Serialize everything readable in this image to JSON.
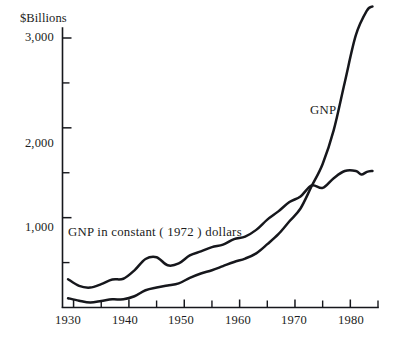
{
  "chart_data": {
    "type": "line",
    "title": "",
    "subtitle": "",
    "xlabel": "",
    "ylabel": "$Billions",
    "unit_label": "$Billions",
    "xlim": [
      1928,
      1985
    ],
    "ylim": [
      0,
      3300
    ],
    "grid": false,
    "legend_position": "inline-annotation",
    "y_ticks_major": [
      1000,
      2000,
      3000
    ],
    "y_tick_labels": [
      "1,000",
      "2,000",
      "3,000"
    ],
    "y_ticks_minor": [
      500,
      1500,
      2500
    ],
    "x_ticks_major": [
      1930,
      1940,
      1950,
      1960,
      1970,
      1980
    ],
    "x_tick_labels": [
      "1930",
      "1940",
      "1950",
      "1960",
      "1970",
      "1980"
    ],
    "x_ticks_minor": [
      1935,
      1945,
      1955,
      1965,
      1975,
      1985
    ],
    "x_axis_end": 1985,
    "annotations": [
      {
        "name": "gnp",
        "text": "GNP",
        "x": 1975,
        "y": 2140
      },
      {
        "name": "gnp-constant",
        "text": "GNP in constant ( 1972 ) dollars",
        "x": 1934,
        "y": 880
      }
    ],
    "series": [
      {
        "name": "GNP",
        "label": "GNP",
        "color": "#16171c",
        "x": [
          1929,
          1931,
          1933,
          1935,
          1937,
          1939,
          1941,
          1943,
          1945,
          1947,
          1949,
          1951,
          1953,
          1955,
          1957,
          1959,
          1961,
          1963,
          1965,
          1967,
          1969,
          1971,
          1973,
          1975,
          1977,
          1979,
          1981,
          1983,
          1984
        ],
        "values": [
          104,
          76,
          56,
          72,
          91,
          91,
          125,
          192,
          223,
          244,
          268,
          330,
          379,
          415,
          461,
          507,
          545,
          603,
          705,
          816,
          960,
          1102,
          1349,
          1598,
          1974,
          2508,
          3031,
          3305,
          3350
        ]
      },
      {
        "name": "GNP in constant (1972) dollars",
        "label": "GNP in constant ( 1972 ) dollars",
        "color": "#16171c",
        "x": [
          1929,
          1931,
          1933,
          1935,
          1937,
          1939,
          1941,
          1943,
          1945,
          1947,
          1949,
          1951,
          1953,
          1955,
          1957,
          1959,
          1961,
          1963,
          1965,
          1967,
          1969,
          1971,
          1973,
          1975,
          1977,
          1979,
          1981,
          1982,
          1983,
          1984
        ],
        "values": [
          315,
          240,
          222,
          260,
          311,
          320,
          414,
          540,
          560,
          470,
          490,
          580,
          624,
          672,
          700,
          762,
          790,
          864,
          978,
          1070,
          1174,
          1236,
          1359,
          1331,
          1440,
          1520,
          1520,
          1480,
          1510,
          1520
        ]
      }
    ]
  },
  "axes": {
    "y_axis_name": "y-axis",
    "x_axis_name": "x-axis"
  }
}
